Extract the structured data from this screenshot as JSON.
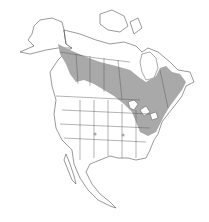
{
  "map": {
    "type": "species-range-map",
    "region": "North America",
    "colors": {
      "background": "#ffffff",
      "land": "#ffffff",
      "outline": "#555555",
      "range": "#a9a9a9"
    },
    "range_regions": [
      "Alaska (east) / Yukon",
      "British Columbia (northeast)",
      "Northwest Territories (south)",
      "Alberta",
      "Saskatchewan",
      "Manitoba",
      "Ontario",
      "Quebec",
      "Atlantic Canada",
      "Great Lakes states",
      "Northeastern US"
    ],
    "isolated_points": [
      {
        "label": "Colorado",
        "x": 95,
        "y": 134
      },
      {
        "label": "Missouri",
        "x": 123,
        "y": 135
      }
    ]
  }
}
